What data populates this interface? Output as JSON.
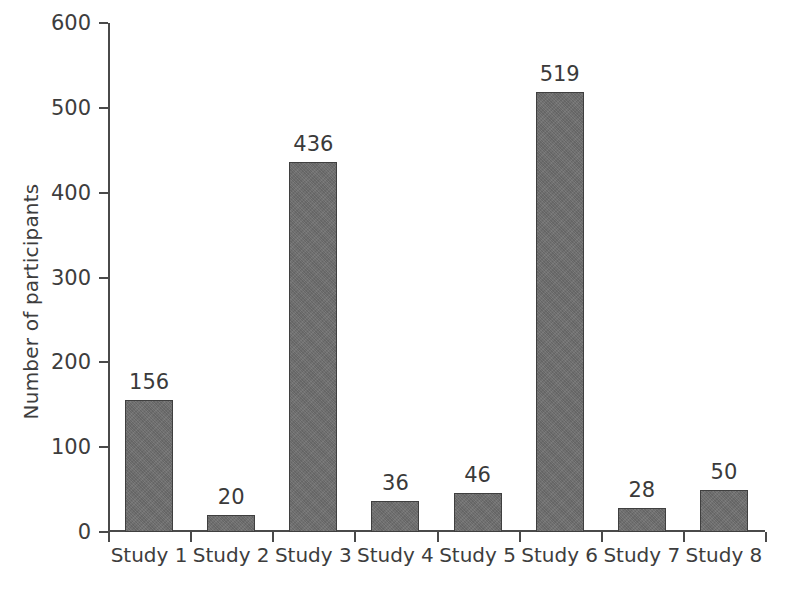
{
  "chart_data": {
    "type": "bar",
    "title": "",
    "xlabel": "",
    "ylabel": "Number of participants",
    "categories": [
      "Study 1",
      "Study 2",
      "Study 3",
      "Study 4",
      "Study 5",
      "Study 6",
      "Study 7",
      "Study 8"
    ],
    "values": [
      156,
      20,
      436,
      36,
      46,
      519,
      28,
      50
    ],
    "value_labels": [
      "156",
      "20",
      "436",
      "36",
      "46",
      "519",
      "28",
      "50"
    ],
    "ylim": [
      0,
      600
    ],
    "ytick_values": [
      0,
      100,
      200,
      300,
      400,
      500,
      600
    ],
    "ytick_labels": [
      "0",
      "100",
      "200",
      "300",
      "400",
      "500",
      "600"
    ],
    "grid": false,
    "legend": false,
    "bar_color": "#6e6e6e",
    "bar_edge_color": "#3f3f3f",
    "axis_color": "#4a4a4a",
    "background_color": "#ffffff",
    "text_color": "#3a3a3a"
  }
}
